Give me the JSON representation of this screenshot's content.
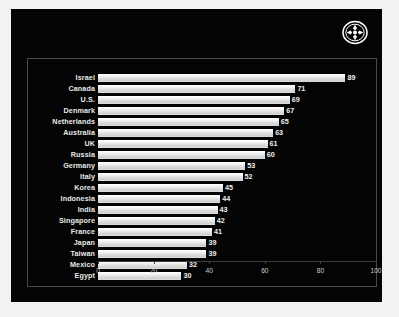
{
  "panel": {
    "background_color": "#040404",
    "page_background_color": "#f2f2f2",
    "frame_border_color": "#4a4a4a",
    "bar_color": "#d8d8d8",
    "label_color": "#e9e9e9"
  },
  "logo": {
    "name": "circular-pinwheel-emblem",
    "color": "#ffffff"
  },
  "chart_data": {
    "type": "bar",
    "orientation": "horizontal",
    "title": "",
    "subtitle": "",
    "xlabel": "",
    "ylabel": "",
    "xlim": [
      0,
      100
    ],
    "xticks": [
      0,
      20,
      40,
      60,
      80,
      100
    ],
    "xtick_labels": [
      "0",
      "20",
      "40",
      "60",
      "80",
      "100"
    ],
    "grid": false,
    "legend": false,
    "categories": [
      "Israel",
      "Canada",
      "U.S.",
      "Denmark",
      "Netherlands",
      "Australia",
      "UK",
      "Russia",
      "Germany",
      "Italy",
      "Korea",
      "Indonesia",
      "India",
      "Singapore",
      "France",
      "Japan",
      "Taiwan",
      "Mexico",
      "Egypt"
    ],
    "values": [
      89,
      71,
      69,
      67,
      65,
      63,
      61,
      60,
      53,
      52,
      45,
      44,
      43,
      42,
      41,
      39,
      39,
      32,
      30
    ],
    "value_labels": [
      "89",
      "71",
      "69",
      "67",
      "65",
      "63",
      "61",
      "60",
      "53",
      "52",
      "45",
      "44",
      "43",
      "42",
      "41",
      "39",
      "39",
      "32",
      "30"
    ]
  }
}
